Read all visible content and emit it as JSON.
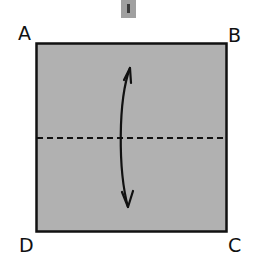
{
  "diagram": {
    "type": "origami-fold-step",
    "paper": {
      "color": "#b1b1b1",
      "border_color": "#111111",
      "x": 36,
      "y": 43,
      "width": 191,
      "height": 189
    },
    "fold_line": {
      "style": "dashed",
      "y": 138,
      "meaning": "valley-fold"
    },
    "arrow": {
      "direction": "bidirectional-vertical",
      "meaning": "fold-and-unfold"
    },
    "corners": {
      "top_left": "A",
      "top_right": "B",
      "bottom_right": "C",
      "bottom_left": "D"
    },
    "top_handle": {
      "icon": "slider-handle-icon",
      "color": "#a0a0a0"
    }
  }
}
